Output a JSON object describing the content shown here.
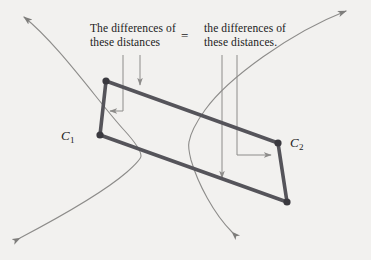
{
  "figure": {
    "background_color": "#f2f1ef",
    "annotations": {
      "left_line1": "The differences of",
      "left_line2": "these distances",
      "equals_sign": "=",
      "right_line1": "the differences of",
      "right_line2": "these distances."
    },
    "points": {
      "c1_label": "C",
      "c1_subscript": "1",
      "c2_label": "C",
      "c2_subscript": "2"
    },
    "colors": {
      "curve": "#8d8c8a",
      "quadrilateral": "#55545a",
      "leader_line": "#8d8c8a",
      "text": "#1b1b1b",
      "vertex_dot": "#3a393f"
    },
    "geometry": {
      "vertex_top_left": [
        106,
        81
      ],
      "vertex_c1": [
        100,
        135
      ],
      "vertex_c2": [
        278,
        143
      ],
      "vertex_bottom_right": [
        287,
        202
      ],
      "left_branch_vertex": [
        141,
        156
      ],
      "right_branch_vertex": [
        190,
        142
      ]
    }
  }
}
